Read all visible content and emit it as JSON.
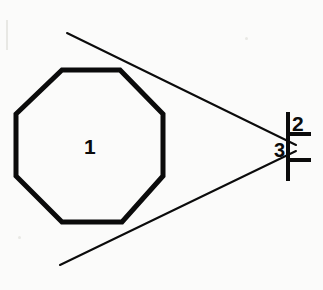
{
  "figure": {
    "background_color": "#fbfbfa",
    "ink_color": "#0b0b0b",
    "width": 323,
    "height": 290,
    "labels": [
      {
        "id": "1",
        "text": "1",
        "role": "octagon-part-number",
        "x": 90,
        "y": 146
      },
      {
        "id": "2",
        "text": "2",
        "role": "upper-dimension-number",
        "x": 298,
        "y": 123
      },
      {
        "id": "3",
        "text": "3",
        "role": "apex-dimension-number",
        "x": 280,
        "y": 150
      }
    ],
    "shapes": {
      "octagon": {
        "name": "octagon",
        "stroke_width": 5,
        "points": "62,70 120,70 163,114 163,176 122,222 62,222 16,176 16,114"
      },
      "tangent_upper": {
        "name": "upper-tangent-line",
        "stroke_width": 2,
        "x1": 67,
        "y1": 33,
        "x2": 296,
        "y2": 145
      },
      "tangent_lower": {
        "name": "lower-tangent-line",
        "stroke_width": 2,
        "x1": 60,
        "y1": 265,
        "x2": 296,
        "y2": 151
      },
      "extension_line": {
        "name": "vertical-extension-line",
        "stroke_width": 4,
        "x1": 288,
        "y1": 112,
        "x2": 288,
        "y2": 181
      },
      "tick_upper": {
        "name": "upper-tick-mark",
        "stroke_width": 4,
        "x1": 288,
        "y1": 134,
        "x2": 311,
        "y2": 134
      },
      "tick_lower": {
        "name": "lower-tick-mark",
        "stroke_width": 4,
        "x1": 288,
        "y1": 160,
        "x2": 311,
        "y2": 160
      }
    }
  }
}
